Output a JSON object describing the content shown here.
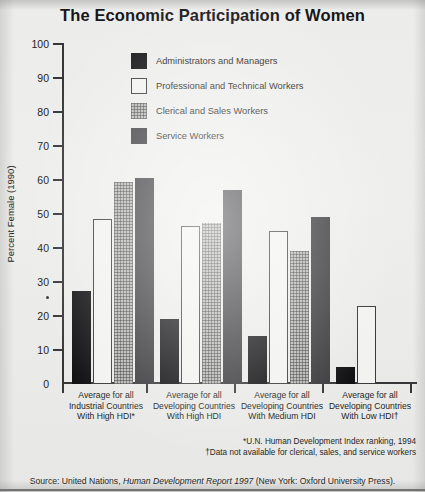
{
  "title": "The Economic Participation of Women",
  "legend": [
    {
      "key": "admin",
      "label": "Administrators and Managers"
    },
    {
      "key": "prof",
      "label": "Professional and Technical Workers"
    },
    {
      "key": "cler",
      "label": "Clerical and Sales Workers"
    },
    {
      "key": "serv",
      "label": "Service Workers"
    }
  ],
  "footnotes": {
    "asterisk": "*U.N. Human Development Index ranking, 1994",
    "dagger": "†Data not available for clerical, sales, and service workers"
  },
  "source": {
    "prefix": "Source: United Nations, ",
    "italic": "Human Development Report 1997",
    "suffix": " (New York: Oxford University Press)."
  },
  "chart_data": {
    "type": "bar",
    "title": "The Economic Participation of Women",
    "xlabel": "",
    "ylabel": "Percent Female (1990)",
    "ylim": [
      0,
      100
    ],
    "yticks": [
      0,
      10,
      20,
      30,
      40,
      50,
      60,
      70,
      80,
      90,
      100
    ],
    "grid": false,
    "legend_position": "top-left-inside",
    "categories": [
      "Average for all\nIndustrial Countries\nWith High HDI*",
      "Average for all\nDeveloping Countries\nWith High HDI",
      "Average for all\nDeveloping Countries\nWith Medium HDI",
      "Average for all\nDeveloping Countries\nWith Low HDI†"
    ],
    "category_lines": [
      [
        "Average for all",
        "Industrial Countries",
        "With High HDI*"
      ],
      [
        "Average for all",
        "Developing Countries",
        "With High HDI"
      ],
      [
        "Average for all",
        "Developing Countries",
        "With Medium HDI"
      ],
      [
        "Average for all",
        "Developing Countries",
        "With Low HDI†"
      ]
    ],
    "series": [
      {
        "name": "Administrators and Managers",
        "key": "admin",
        "values": [
          27.5,
          19,
          14,
          5
        ]
      },
      {
        "name": "Professional and Technical Workers",
        "key": "prof",
        "values": [
          48.5,
          46.5,
          45,
          23
        ]
      },
      {
        "name": "Clerical and Sales Workers",
        "key": "cler",
        "values": [
          59.5,
          47.5,
          39,
          null
        ]
      },
      {
        "name": "Service Workers",
        "key": "serv",
        "values": [
          60.5,
          57,
          49,
          null
        ]
      }
    ]
  }
}
